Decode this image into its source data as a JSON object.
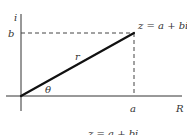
{
  "diagram": {
    "type": "complex-plane-polar-form",
    "axes": {
      "vertical_label": "i",
      "horizontal_label": "R"
    },
    "point": {
      "label": "z = a + bi",
      "x_label": "a",
      "y_label": "b"
    },
    "vector": {
      "magnitude_label": "r",
      "angle_label": "θ"
    },
    "caption": "z = a + bi",
    "colors": {
      "line": "#111111",
      "axis": "#333333",
      "dashed": "#444444",
      "text": "#333333"
    }
  }
}
